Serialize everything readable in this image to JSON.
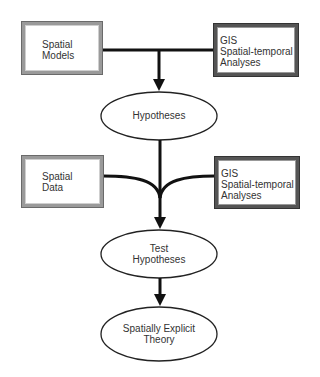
{
  "diagram": {
    "nodes": {
      "spatial_models": {
        "line1": "Spatial",
        "line2": "Models"
      },
      "gis_analyses_1": {
        "line1": "GIS",
        "line2": "Spatial-temporal",
        "line3": "Analyses"
      },
      "hypotheses": {
        "label": "Hypotheses"
      },
      "spatial_data": {
        "line1": "Spatial",
        "line2": "Data"
      },
      "gis_analyses_2": {
        "line1": "GIS",
        "line2": "Spatial-temporal",
        "line3": "Analyses"
      },
      "test_hypotheses": {
        "line1": "Test",
        "line2": "Hypotheses"
      },
      "theory": {
        "line1": "Spatially Explicit",
        "line2": "Theory"
      }
    },
    "edges": [
      {
        "from": [
          "Spatial Models",
          "GIS Spatial-temporal Analyses"
        ],
        "to": "Hypotheses"
      },
      {
        "from": [
          "Hypotheses",
          "Spatial Data",
          "GIS Spatial-temporal Analyses"
        ],
        "to": "Test Hypotheses"
      },
      {
        "from": [
          "Test Hypotheses"
        ],
        "to": "Spatially Explicit Theory"
      }
    ]
  }
}
